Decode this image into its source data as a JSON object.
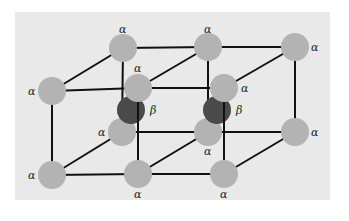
{
  "diagram": {
    "type": "crystal-lattice",
    "colors": {
      "background_panel": "#e9e9e9",
      "alpha_atom": "#b3b3b3",
      "beta_atom": "#4a4a4a",
      "bond": "#111111"
    },
    "atoms": [
      {
        "id": "a_back_top_1",
        "species": "alpha",
        "label": "α",
        "x": 123,
        "y": 48,
        "label_x": 119,
        "label_y": 33
      },
      {
        "id": "a_back_top_2",
        "species": "alpha",
        "label": "α",
        "x": 208,
        "y": 47,
        "label_x": 204,
        "label_y": 33
      },
      {
        "id": "a_back_top_3",
        "species": "alpha",
        "label": "α",
        "x": 295,
        "y": 47,
        "label_x": 311,
        "label_y": 51
      },
      {
        "id": "a_front_top_1",
        "species": "alpha",
        "label": "α",
        "x": 52,
        "y": 91,
        "label_x": 28,
        "label_y": 95
      },
      {
        "id": "a_front_top_2",
        "species": "alpha",
        "label": "α",
        "x": 138,
        "y": 88,
        "label_x": 134,
        "label_y": 72
      },
      {
        "id": "a_front_top_3",
        "species": "alpha",
        "label": "α",
        "x": 224,
        "y": 88,
        "label_x": 241,
        "label_y": 92
      },
      {
        "id": "b_center_1",
        "species": "beta",
        "label": "β",
        "x": 131,
        "y": 110,
        "label_x": 150,
        "label_y": 114
      },
      {
        "id": "b_center_2",
        "species": "beta",
        "label": "β",
        "x": 217,
        "y": 110,
        "label_x": 236,
        "label_y": 114
      },
      {
        "id": "a_back_bot_1",
        "species": "alpha",
        "label": "α",
        "x": 122,
        "y": 132,
        "label_x": 98,
        "label_y": 136
      },
      {
        "id": "a_back_bot_2",
        "species": "alpha",
        "label": "α",
        "x": 208,
        "y": 132,
        "label_x": 204,
        "label_y": 155
      },
      {
        "id": "a_back_bot_3",
        "species": "alpha",
        "label": "α",
        "x": 295,
        "y": 132,
        "label_x": 311,
        "label_y": 136
      },
      {
        "id": "a_front_bot_1",
        "species": "alpha",
        "label": "α",
        "x": 52,
        "y": 175,
        "label_x": 28,
        "label_y": 179
      },
      {
        "id": "a_front_bot_2",
        "species": "alpha",
        "label": "α",
        "x": 138,
        "y": 174,
        "label_x": 134,
        "label_y": 198
      },
      {
        "id": "a_front_bot_3",
        "species": "alpha",
        "label": "α",
        "x": 224,
        "y": 174,
        "label_x": 220,
        "label_y": 198
      }
    ],
    "bonds": [
      [
        "a_back_top_1",
        "a_back_top_2"
      ],
      [
        "a_back_top_2",
        "a_back_top_3"
      ],
      [
        "a_front_top_1",
        "a_front_top_2"
      ],
      [
        "a_front_top_2",
        "a_front_top_3"
      ],
      [
        "a_back_bot_1",
        "a_back_bot_2"
      ],
      [
        "a_back_bot_2",
        "a_back_bot_3"
      ],
      [
        "a_front_bot_1",
        "a_front_bot_2"
      ],
      [
        "a_front_bot_2",
        "a_front_bot_3"
      ],
      [
        "a_back_top_1",
        "a_front_top_1"
      ],
      [
        "a_back_top_2",
        "a_front_top_2"
      ],
      [
        "a_back_top_3",
        "a_front_top_3"
      ],
      [
        "a_back_bot_1",
        "a_front_bot_1"
      ],
      [
        "a_back_bot_2",
        "a_front_bot_2"
      ],
      [
        "a_back_bot_3",
        "a_front_bot_3"
      ],
      [
        "a_front_top_1",
        "a_front_bot_1"
      ],
      [
        "a_front_top_2",
        "a_front_bot_2"
      ],
      [
        "a_front_top_3",
        "a_front_bot_3"
      ],
      [
        "a_back_top_1",
        "a_back_bot_1"
      ],
      [
        "a_back_top_2",
        "a_back_bot_2"
      ],
      [
        "a_back_top_3",
        "a_back_bot_3"
      ]
    ],
    "atom_radius": 14
  }
}
